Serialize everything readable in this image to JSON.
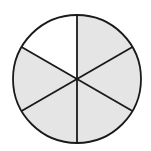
{
  "diagram": {
    "type": "fraction-circle",
    "total_parts": 6,
    "shaded_parts": 5,
    "unshaded_parts": 1,
    "shaded_color": "#e5e5e5",
    "unshaded_color": "#ffffff",
    "stroke_color": "#1a1a1a"
  }
}
